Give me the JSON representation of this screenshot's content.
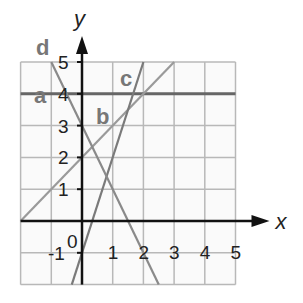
{
  "chart_data": {
    "type": "line",
    "title": "",
    "xlabel": "x",
    "ylabel": "y",
    "xlim": [
      -2,
      5
    ],
    "ylim": [
      -2,
      5
    ],
    "grid": true,
    "x_ticks": [
      "1",
      "2",
      "3",
      "4",
      "5"
    ],
    "y_ticks": [
      "-1",
      "1",
      "2",
      "3",
      "4",
      "5"
    ],
    "origin_label": "0",
    "series": [
      {
        "name": "a",
        "equation": "y = 4",
        "points": [
          [
            -2,
            4
          ],
          [
            5,
            4
          ]
        ],
        "color": "#666666"
      },
      {
        "name": "b",
        "equation": "y = x + 2",
        "points": [
          [
            -2,
            0
          ],
          [
            3,
            5
          ]
        ],
        "color": "#9a9a9a"
      },
      {
        "name": "c",
        "equation": "y = 3x - 1",
        "points": [
          [
            -0.333,
            -2
          ],
          [
            2,
            5
          ]
        ],
        "color": "#7a7a7a"
      },
      {
        "name": "d",
        "equation": "y = -2x + 3",
        "points": [
          [
            -1,
            5
          ],
          [
            2.5,
            -2
          ]
        ],
        "color": "#8a8a8a"
      }
    ]
  }
}
